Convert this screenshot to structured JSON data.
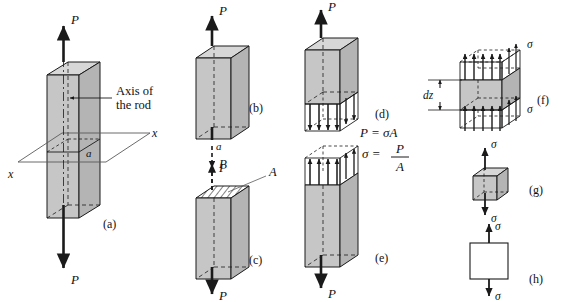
{
  "figure": {
    "colors": {
      "stroke": "#1a1a1a",
      "face_light": "#d7d7d7",
      "face_mid": "#c6c6c6",
      "face_dark": "#b4b4b4",
      "white": "#ffffff",
      "hatch": "#1a1a1a",
      "background": "#ffffff"
    }
  },
  "panels": {
    "a": {
      "tag": "(a)",
      "load_top": "P",
      "load_bottom": "P",
      "axis_label_line1": "Axis of",
      "axis_label_line2": "the rod",
      "section_left": "x",
      "section_right": "x",
      "section_mark": "a"
    },
    "b": {
      "tag": "(b)",
      "load_top": "P",
      "load_bottom": "P",
      "section_mark": "a"
    },
    "c": {
      "tag": "(c)",
      "load_top": "P",
      "load_bottom": "P",
      "area_label": "A"
    },
    "d": {
      "tag": "(d)",
      "load_top": "P",
      "equation": "P = σA"
    },
    "e": {
      "tag": "(e)",
      "load_bottom": "P",
      "equation_lhs": "σ =",
      "equation_num": "P",
      "equation_den": "A"
    },
    "f": {
      "tag": "(f)",
      "stress_top": "σ",
      "stress_bottom": "σ",
      "thickness": "dz"
    },
    "g": {
      "tag": "(g)",
      "stress_top": "σ",
      "stress_bottom": "σ"
    },
    "h": {
      "tag": "(h)",
      "stress_top": "σ",
      "stress_bottom": "σ"
    }
  }
}
